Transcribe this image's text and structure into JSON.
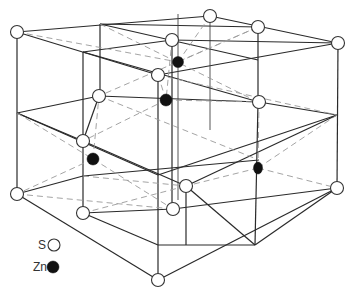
{
  "figure": {
    "legend": {
      "items": [
        {
          "label": "S",
          "symbol": "open-circle",
          "color": "#ffffff"
        },
        {
          "label": "Zn",
          "symbol": "filled-circle",
          "color": "#111111"
        }
      ]
    },
    "atoms": {
      "S": [
        [
          17,
          32
        ],
        [
          210,
          16
        ],
        [
          258,
          27
        ],
        [
          338,
          43
        ],
        [
          172,
          40
        ],
        [
          158,
          75
        ],
        [
          99,
          96
        ],
        [
          259,
          102
        ],
        [
          83,
          141
        ],
        [
          186,
          186
        ],
        [
          17,
          194
        ],
        [
          173,
          209
        ],
        [
          337,
          188
        ],
        [
          84,
          213
        ],
        [
          158,
          280
        ],
        [
          338,
          188
        ]
      ],
      "Zn": [
        [
          178,
          62
        ],
        [
          166,
          100
        ],
        [
          93,
          159
        ],
        [
          258,
          168
        ]
      ]
    },
    "colors": {
      "edge": "#2a2a2a",
      "dashed_bond": "#9a9a9a",
      "background": "#ffffff"
    }
  }
}
